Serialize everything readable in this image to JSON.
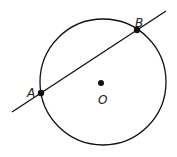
{
  "diagram": {
    "type": "geometry",
    "circle": {
      "center_label": "O",
      "cx": 103,
      "cy": 82,
      "r": 63
    },
    "points": [
      {
        "label": "A",
        "x": 41,
        "y": 93,
        "label_x": 27,
        "label_y": 93
      },
      {
        "label": "B",
        "x": 137,
        "y": 30,
        "label_x": 135,
        "label_y": 23
      },
      {
        "label": "O",
        "x": 101,
        "y": 83,
        "label_x": 99,
        "label_y": 101
      }
    ],
    "line": {
      "x1": 12,
      "y1": 112,
      "x2": 166,
      "y2": 11,
      "through": [
        "A",
        "B"
      ]
    },
    "colors": {
      "stroke": "#111111",
      "background": "#ffffff"
    }
  }
}
